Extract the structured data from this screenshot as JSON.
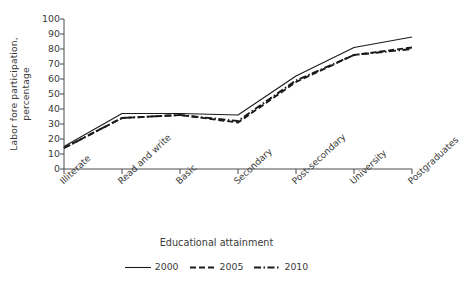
{
  "chart_data": {
    "type": "line",
    "title": "",
    "subtitle": "",
    "xlabel": "Educational attainment",
    "ylabel_line1": "Labor fore participation,",
    "ylabel_line2": "percentage",
    "categories": [
      "Illiterate",
      "Read and write",
      "Basic",
      "Secondary",
      "Post-secondary",
      "University",
      "Postgraduates"
    ],
    "series": [
      {
        "name": "2000",
        "style": "solid",
        "color": "#1a1a1a",
        "values": [
          15,
          37,
          37,
          36,
          62,
          81,
          88
        ]
      },
      {
        "name": "2005",
        "style": "dashed",
        "color": "#1a1a1a",
        "values": [
          14,
          34,
          36,
          31,
          58,
          76,
          81
        ]
      },
      {
        "name": "2010",
        "style": "dashdot",
        "color": "#1a1a1a",
        "values": [
          14,
          34,
          36,
          32,
          59,
          76,
          80
        ]
      }
    ],
    "ylim": [
      0,
      100
    ],
    "yticks": [
      0,
      10,
      20,
      30,
      40,
      50,
      60,
      70,
      80,
      90,
      100
    ],
    "ytick_labels": [
      "0",
      "10",
      "20",
      "30",
      "40",
      "50",
      "60",
      "70",
      "80",
      "90",
      "100"
    ],
    "grid": false,
    "legend_position": "bottom",
    "legend_entries": [
      "2000",
      "2005",
      "2010"
    ],
    "axis_color": "#4a4a4a"
  }
}
